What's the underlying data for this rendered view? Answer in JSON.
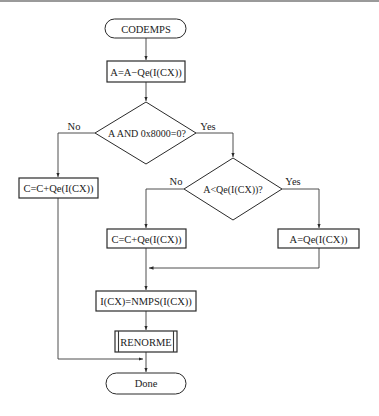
{
  "diagram": {
    "type": "flowchart",
    "nodes": {
      "start": "CODEMPS",
      "subtract_qe": "A=A−Qe(I(CX))",
      "decision_sign": "A AND 0x8000=0?",
      "left_add_c": "C=C+Qe(I(CX))",
      "decision_compare": "A<Qe(I(CX))?",
      "mid_add_c": "C=C+Qe(I(CX))",
      "set_a": "A=Qe(I(CX))",
      "nmps": "I(CX)=NMPS(I(CX))",
      "renorme": "RENORME",
      "end": "Done"
    },
    "labels": {
      "d1_no": "No",
      "d1_yes": "Yes",
      "d2_no": "No",
      "d2_yes": "Yes"
    },
    "edges": [
      {
        "from": "start",
        "to": "subtract_qe"
      },
      {
        "from": "subtract_qe",
        "to": "decision_sign"
      },
      {
        "from": "decision_sign",
        "to": "left_add_c",
        "label": "No"
      },
      {
        "from": "decision_sign",
        "to": "decision_compare",
        "label": "Yes"
      },
      {
        "from": "decision_compare",
        "to": "mid_add_c",
        "label": "No"
      },
      {
        "from": "decision_compare",
        "to": "set_a",
        "label": "Yes"
      },
      {
        "from": "mid_add_c",
        "to": "nmps"
      },
      {
        "from": "set_a",
        "to": "nmps"
      },
      {
        "from": "nmps",
        "to": "renorme"
      },
      {
        "from": "renorme",
        "to": "end"
      },
      {
        "from": "left_add_c",
        "to": "end"
      }
    ]
  }
}
